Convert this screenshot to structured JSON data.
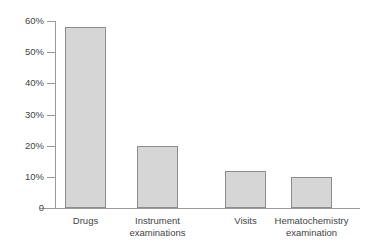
{
  "chart_data": {
    "type": "bar",
    "title": "",
    "subtitle": "",
    "xlabel": "",
    "ylabel": "",
    "categories": [
      "Drugs",
      "Instrument examinations",
      "Visits",
      "Hematochemistry examination"
    ],
    "category_lines": [
      [
        "Drugs"
      ],
      [
        "Instrument",
        "examinations"
      ],
      [
        "Visits"
      ],
      [
        "Hematochemistry",
        "examination"
      ]
    ],
    "values": [
      58,
      20,
      12,
      10
    ],
    "value_labels": [
      "58%",
      "20%",
      "12%",
      "10%"
    ],
    "ylim": [
      0,
      60
    ],
    "ytick_values": [
      0,
      10,
      20,
      30,
      40,
      50,
      60
    ],
    "ytick_labels": [
      "0",
      "10%",
      "20%",
      "30%",
      "40%",
      "50%",
      "60%"
    ],
    "grid": false,
    "legend": null,
    "legend_position": "none",
    "bar_fill_color": "#d6d6d6",
    "bar_border_color": "#8d8d8d",
    "axis_color": "#9a9a9a",
    "text_color": "#444444",
    "background_color": "#ffffff"
  }
}
